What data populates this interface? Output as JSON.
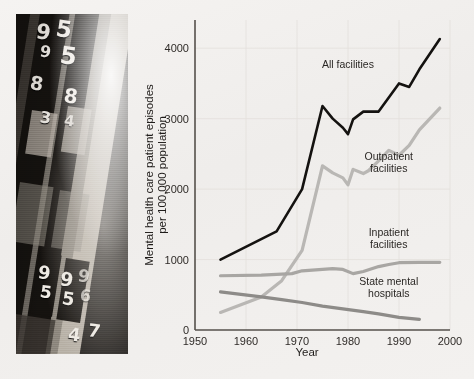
{
  "figure": {
    "background_color": "#f2f0ee",
    "photo": {
      "alt_name": "archival-patient-record-binders-photo",
      "caption": "",
      "visible_numbers": [
        "9",
        "5",
        "9",
        "5",
        "8",
        "8",
        "3",
        "4",
        "9",
        "5",
        "9",
        "5",
        "9",
        "6",
        "4",
        "7"
      ]
    }
  },
  "chart_data": {
    "type": "line",
    "title": "",
    "subtitle": "",
    "xlabel": "Year",
    "ylabel": "Mental health care patient episodes per 100,000 population",
    "ylabel_line1": "Mental health care patient episodes",
    "ylabel_line2": "per 100,000 population",
    "xlim": [
      1950,
      2000
    ],
    "ylim": [
      0,
      4400
    ],
    "xticks": [
      1950,
      1960,
      1970,
      1980,
      1990,
      2000
    ],
    "xticklabels": [
      "1950",
      "1960",
      "1970",
      "1980",
      "1990",
      "2000"
    ],
    "yticks": [
      0,
      1000,
      2000,
      3000,
      4000
    ],
    "yticklabels": [
      "0",
      "1000",
      "2000",
      "3000",
      "4000"
    ],
    "grid": true,
    "grid_axis": "both",
    "legend_position": "inline-annotations",
    "series": [
      {
        "name": "All facilities",
        "label": "All facilities",
        "color": "#141210",
        "width": 2.6,
        "label_x": 1980,
        "label_y": 3720,
        "x": [
          1955,
          1966,
          1971,
          1975,
          1977,
          1979,
          1980,
          1981,
          1983,
          1986,
          1988,
          1990,
          1992,
          1994,
          1998
        ],
        "values": [
          1000,
          1400,
          2000,
          3180,
          3000,
          2870,
          2780,
          2990,
          3100,
          3100,
          3300,
          3500,
          3450,
          3700,
          4130
        ]
      },
      {
        "name": "Outpatient facilities",
        "label": "Outpatient facilities",
        "label_line1": "Outpatient",
        "label_line2": "facilities",
        "color": "#b9b7b4",
        "width": 3.2,
        "label_x": 1988,
        "label_y": 2420,
        "x": [
          1955,
          1963,
          1967,
          1971,
          1975,
          1977,
          1979,
          1980,
          1981,
          1983,
          1984,
          1986,
          1988,
          1990,
          1992,
          1994,
          1998
        ],
        "values": [
          250,
          470,
          700,
          1130,
          2330,
          2230,
          2160,
          2060,
          2280,
          2220,
          2260,
          2400,
          2550,
          2480,
          2620,
          2840,
          3150
        ]
      },
      {
        "name": "Inpatient facilities",
        "label": "Inpatient facilities",
        "label_line1": "Inpatient",
        "label_line2": "facilities",
        "color": "#a8a6a3",
        "width": 3.2,
        "label_x": 1988,
        "label_y": 1340,
        "x": [
          1955,
          1963,
          1969,
          1971,
          1975,
          1977,
          1979,
          1981,
          1983,
          1986,
          1988,
          1990,
          1994,
          1998
        ],
        "values": [
          770,
          780,
          800,
          840,
          860,
          870,
          860,
          800,
          830,
          900,
          930,
          955,
          960,
          960
        ]
      },
      {
        "name": "State mental hospitals",
        "label": "State mental hospitals",
        "label_line1": "State mental",
        "label_line2": "hospitals",
        "color": "#8d8b88",
        "width": 3.2,
        "label_x": 1988,
        "label_y": 640,
        "x": [
          1955,
          1963,
          1967,
          1971,
          1975,
          1979,
          1983,
          1986,
          1990,
          1994
        ],
        "values": [
          540,
          470,
          430,
          390,
          340,
          300,
          260,
          230,
          180,
          150
        ]
      }
    ]
  }
}
